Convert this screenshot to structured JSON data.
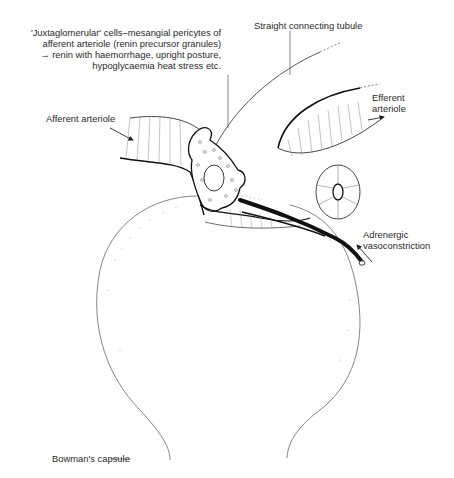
{
  "diagram": {
    "type": "anatomical-illustration",
    "labels": {
      "juxtaglomerular": {
        "line1": "'Juxtaglomerular' cells–mesangial pericytes of",
        "line2": "afferent arteriole (renin precursor granules)",
        "line3": "→ renin with haemorrhage, upright posture,",
        "line4": "hypoglycaemia heat stress etc."
      },
      "straight_tubule": "Straight connecting tubule",
      "efferent": {
        "line1": "Efferent",
        "line2": "arteriole"
      },
      "afferent": "Afferent arteriole",
      "adrenergic": {
        "line1": "Adrenergic",
        "line2": "vasoconstriction"
      },
      "bowman": "Bowman's capsule"
    },
    "structures": [
      "afferent-arteriole",
      "efferent-arteriole",
      "juxtaglomerular-cell",
      "straight-connecting-tubule",
      "tubule-cross-section",
      "adrenergic-nerve-fibre",
      "bowmans-capsule"
    ]
  }
}
